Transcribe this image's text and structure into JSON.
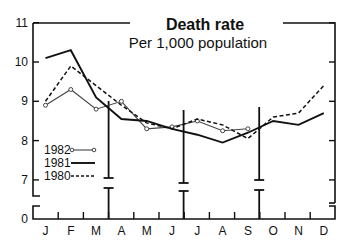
{
  "chart_data": {
    "type": "line",
    "title": "Death rate",
    "subtitle": "Per 1,000 population",
    "xlabel": "",
    "ylabel": "",
    "categories": [
      "J",
      "F",
      "M",
      "A",
      "M",
      "J",
      "J",
      "A",
      "S",
      "O",
      "N",
      "D"
    ],
    "yticks": [
      0,
      7,
      8,
      9,
      10,
      11
    ],
    "ylim": [
      0,
      11
    ],
    "axis_break": true,
    "grid": false,
    "legend_position": "lower-left inside",
    "series": [
      {
        "name": "1982",
        "style": "thin line with open circle markers",
        "values": [
          8.9,
          9.3,
          8.8,
          9.0,
          8.3,
          8.35,
          8.5,
          8.25,
          8.3,
          null,
          null,
          null
        ]
      },
      {
        "name": "1981",
        "style": "solid thick line",
        "values": [
          10.1,
          10.3,
          9.1,
          8.55,
          8.5,
          8.3,
          8.15,
          7.95,
          8.2,
          8.5,
          8.4,
          8.7
        ]
      },
      {
        "name": "1980",
        "style": "dashed line",
        "values": [
          9.0,
          9.9,
          9.4,
          8.9,
          8.45,
          8.3,
          8.55,
          8.4,
          8.05,
          8.6,
          8.7,
          9.4
        ]
      }
    ],
    "quarter_markers": [
      "end of March",
      "end of June",
      "end of September"
    ]
  },
  "labels": {
    "title": "Death rate",
    "subtitle": "Per 1,000 population",
    "y0": "0",
    "y7": "7",
    "y8": "8",
    "y9": "9",
    "y10": "10",
    "y11": "11",
    "months": [
      "J",
      "F",
      "M",
      "A",
      "M",
      "J",
      "J",
      "A",
      "S",
      "O",
      "N",
      "D"
    ],
    "legend": [
      "1982",
      "1981",
      "1980"
    ]
  }
}
